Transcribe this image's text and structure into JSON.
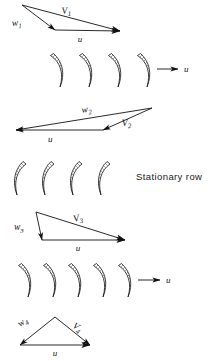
{
  "figure": {
    "background_color": "#ffffff",
    "line_color": "#111111",
    "width": 220,
    "height": 361
  },
  "annotations": {
    "stationary_row": "Stationary row"
  },
  "triangles": [
    {
      "id": "triangle-1",
      "labels": {
        "relative": "w",
        "relative_sub": "1",
        "absolute": "V",
        "absolute_sub": "1",
        "blade_speed": "u"
      },
      "apex": [
        22,
        5
      ],
      "tail": [
        55,
        30
      ],
      "head": [
        120,
        31
      ],
      "u_direction": "right"
    },
    {
      "id": "triangle-2",
      "labels": {
        "relative": "w",
        "relative_sub": "2",
        "absolute": "V",
        "absolute_sub": "2",
        "blade_speed": "u"
      },
      "apex": [
        152,
        108
      ],
      "tail": [
        103,
        130
      ],
      "head": [
        16,
        130
      ],
      "u_direction": "left"
    },
    {
      "id": "triangle-3",
      "labels": {
        "relative": "w",
        "relative_sub": "3",
        "absolute": "V",
        "absolute_sub": "3",
        "blade_speed": "u"
      },
      "apex": [
        36,
        212
      ],
      "tail": [
        42,
        240
      ],
      "head": [
        125,
        240
      ],
      "u_direction": "right"
    },
    {
      "id": "triangle-4",
      "labels": {
        "relative": "w",
        "relative_sub": "4",
        "absolute": "V",
        "absolute_sub": "4",
        "blade_speed": "u"
      },
      "apex": [
        55,
        317
      ],
      "tail": [
        20,
        345
      ],
      "head": [
        90,
        345
      ],
      "u_direction": "right"
    }
  ],
  "blade_rows": [
    {
      "id": "blade-row-1",
      "type": "moving",
      "orientation": "convex-left",
      "count": 4,
      "arrow_label": "u",
      "has_arrow": true
    },
    {
      "id": "blade-row-2",
      "type": "stationary",
      "orientation": "convex-right",
      "count": 4,
      "arrow_label": "",
      "has_arrow": false
    },
    {
      "id": "blade-row-3",
      "type": "moving",
      "orientation": "convex-left",
      "count": 5,
      "arrow_label": "u",
      "has_arrow": true
    }
  ]
}
